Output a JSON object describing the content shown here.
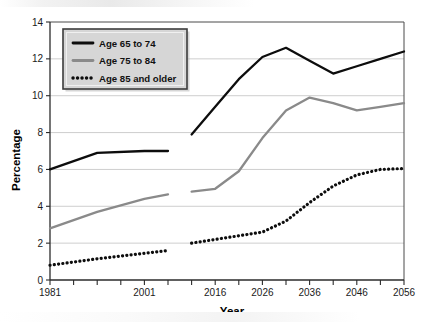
{
  "chart_data": {
    "type": "line",
    "title": "",
    "xlabel": "Year",
    "ylabel": "Percentage",
    "xlim": [
      1981,
      2056
    ],
    "ylim": [
      0,
      14
    ],
    "ytick_step": 2,
    "yticks": [
      0,
      2,
      4,
      6,
      8,
      10,
      12,
      14
    ],
    "ytick_labels": [
      "0",
      "2",
      "4",
      "6",
      "8",
      "10",
      "12",
      "14"
    ],
    "xticks": [
      1981,
      1986,
      1991,
      1996,
      2001,
      2006,
      2011,
      2016,
      2021,
      2026,
      2031,
      2036,
      2041,
      2046,
      2051,
      2056
    ],
    "xtick_labels_shown": [
      "1981",
      "2001",
      "2016",
      "2026",
      "2036",
      "2046",
      "2056"
    ],
    "xtick_label_values": [
      1981,
      2001,
      2016,
      2026,
      2036,
      2046,
      2056
    ],
    "grid": "horizontal",
    "legend_position": "top-left",
    "colors": {
      "age_65_74": "#0d0d0d",
      "age_75_84": "#8a8a8a",
      "age_85_plus": "#0d0d0d",
      "gridline": "#c8c8c8",
      "axis": "#4a4a4a",
      "legend_fill": "#d6d6d6",
      "legend_border": "#3c3c3c",
      "plot_background": "#ffffff"
    },
    "series": [
      {
        "name": "Age 65 to 74",
        "key": "age_65_74",
        "style": "solid",
        "color": "#0d0d0d",
        "segments": [
          {
            "kind": "historical",
            "x": [
              1981,
              1991,
              2001,
              2006
            ],
            "values": [
              6.0,
              6.9,
              7.0,
              7.0
            ]
          },
          {
            "kind": "projected",
            "x": [
              2011,
              2016,
              2021,
              2026,
              2031,
              2036,
              2041,
              2046,
              2051,
              2056
            ],
            "values": [
              7.9,
              9.4,
              10.9,
              12.1,
              12.6,
              11.9,
              11.2,
              11.6,
              12.0,
              12.4
            ]
          }
        ]
      },
      {
        "name": "Age 75 to 84",
        "key": "age_75_84",
        "style": "solid",
        "color": "#8a8a8a",
        "segments": [
          {
            "kind": "historical",
            "x": [
              1981,
              1991,
              2001,
              2006
            ],
            "values": [
              2.8,
              3.7,
              4.4,
              4.65
            ]
          },
          {
            "kind": "projected",
            "x": [
              2011,
              2016,
              2021,
              2026,
              2031,
              2036,
              2041,
              2046,
              2051,
              2056
            ],
            "values": [
              4.8,
              4.95,
              5.9,
              7.7,
              9.2,
              9.9,
              9.6,
              9.2,
              9.4,
              9.6
            ]
          }
        ]
      },
      {
        "name": "Age 85 and older",
        "key": "age_85_plus",
        "style": "dotted",
        "color": "#0d0d0d",
        "segments": [
          {
            "kind": "historical",
            "x": [
              1981,
              1991,
              2001,
              2006
            ],
            "values": [
              0.8,
              1.15,
              1.45,
              1.6
            ]
          },
          {
            "kind": "projected",
            "x": [
              2011,
              2016,
              2021,
              2026,
              2031,
              2036,
              2041,
              2046,
              2051,
              2056
            ],
            "values": [
              2.0,
              2.2,
              2.4,
              2.6,
              3.2,
              4.2,
              5.1,
              5.7,
              6.0,
              6.05
            ]
          }
        ]
      }
    ],
    "legend": [
      {
        "label": "Age 65 to 74",
        "style": "solid",
        "color": "#0d0d0d"
      },
      {
        "label": "Age 75 to 84",
        "style": "solid",
        "color": "#8a8a8a"
      },
      {
        "label": "Age 85 and older",
        "style": "dotted",
        "color": "#0d0d0d"
      }
    ]
  }
}
